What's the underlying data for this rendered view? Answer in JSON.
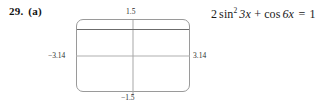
{
  "problem": {
    "number": "29.",
    "part": "(a)"
  },
  "equation": {
    "coefficient": "2",
    "sin_func": "sin",
    "sin_power": "2",
    "sin_arg": "3x",
    "plus": "+",
    "cos_func": "cos",
    "cos_arg": "6x",
    "equals": "=",
    "right_side": "1",
    "full_text": "2 sin² 3x + cos 6x = 1"
  },
  "graph": {
    "window": {
      "xmin_label": "−3.14",
      "xmax_label": "3.14",
      "ymax_label": "1.5",
      "ymin_label": "−1.5",
      "xmin": -3.14,
      "xmax": 3.14,
      "ymin": -1.5,
      "ymax": 1.5
    },
    "colors": {
      "frame": "#9a9a9a",
      "axis": "#b0b0b0",
      "curve": "#6b6b6b",
      "background": "#ffffff",
      "text": "#1a1a1a"
    }
  },
  "chart_data": {
    "type": "line",
    "title": "",
    "xlabel": "",
    "ylabel": "",
    "xlim": [
      -3.14,
      3.14
    ],
    "ylim": [
      -1.5,
      1.5
    ],
    "grid": false,
    "legend": "none",
    "tick_labels": {
      "x": [
        "−3.14",
        "3.14"
      ],
      "y": [
        "−1.5",
        "1.5"
      ]
    },
    "annotations": [
      "2 sin² 3x + cos 6x = 1"
    ],
    "series": [
      {
        "name": "y = 2 sin² 3x + cos 6x",
        "note": "Identity: equals the constant 1 for all x; graph renders as a horizontal line at y = 1.",
        "x": [
          -3.14,
          -2.355,
          -1.57,
          -0.785,
          0,
          0.785,
          1.57,
          2.355,
          3.14
        ],
        "values": [
          1,
          1,
          1,
          1,
          1,
          1,
          1,
          1,
          1
        ]
      }
    ]
  }
}
